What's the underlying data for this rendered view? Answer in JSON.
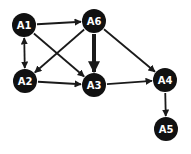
{
  "diagram": {
    "type": "directed-graph",
    "colors": {
      "node_fill": "#111111",
      "node_label": "#ffffff",
      "edge": "#1a1a1a",
      "background": "#ffffff"
    },
    "nodes": [
      {
        "id": "A1",
        "label": "A1",
        "x": 24,
        "y": 25
      },
      {
        "id": "A6",
        "label": "A6",
        "x": 94,
        "y": 21
      },
      {
        "id": "A2",
        "label": "A2",
        "x": 25,
        "y": 81
      },
      {
        "id": "A3",
        "label": "A3",
        "x": 94,
        "y": 85
      },
      {
        "id": "A4",
        "label": "A4",
        "x": 165,
        "y": 80
      },
      {
        "id": "A5",
        "label": "A5",
        "x": 166,
        "y": 129
      }
    ],
    "node_radius": 12,
    "edges": [
      {
        "from": "A1",
        "to": "A6",
        "weight": "normal",
        "bidirectional": false
      },
      {
        "from": "A1",
        "to": "A2",
        "weight": "normal",
        "bidirectional": true
      },
      {
        "from": "A1",
        "to": "A3",
        "weight": "normal",
        "bidirectional": false
      },
      {
        "from": "A6",
        "to": "A2",
        "weight": "normal",
        "bidirectional": false
      },
      {
        "from": "A6",
        "to": "A3",
        "weight": "thick",
        "bidirectional": false
      },
      {
        "from": "A6",
        "to": "A4",
        "weight": "normal",
        "bidirectional": false
      },
      {
        "from": "A2",
        "to": "A3",
        "weight": "normal",
        "bidirectional": false
      },
      {
        "from": "A3",
        "to": "A4",
        "weight": "normal",
        "bidirectional": false
      },
      {
        "from": "A4",
        "to": "A5",
        "weight": "normal",
        "bidirectional": false
      }
    ]
  }
}
